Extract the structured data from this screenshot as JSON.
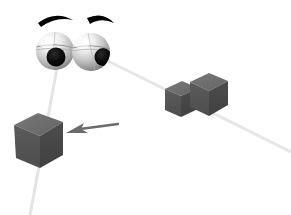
{
  "scene": {
    "title": "Gaze direction illustration",
    "description": "Two cartoon eyeballs with eyebrows look in two directions; faint gaze rays extend toward dark grey cubes, and an arrow points at the lower-left cube.",
    "width": 291,
    "height": 215,
    "background_color": "#ffffff"
  },
  "colors": {
    "background": "#ffffff",
    "eyebrow": "#000000",
    "pupil": "#000000",
    "sclera_light": "#f2f2f2",
    "sclera_mid": "#b9b9b9",
    "sclera_dark": "#8a8a8a",
    "cube_top": "#6e6e6e",
    "cube_left": "#555555",
    "cube_right": "#464646",
    "cube_small_top": "#7a7a7a",
    "cube_small_left": "#626262",
    "arrow": "#6b6b6b",
    "gaze_ray": "#e2e2e2"
  },
  "eyes": [
    {
      "name": "left-eye",
      "label": "Left eyeball",
      "cx": 55,
      "cy": 51,
      "r": 19,
      "pupil_cx": 56,
      "pupil_cy": 57,
      "pupil_r": 9,
      "gaze_target": "left-cube"
    },
    {
      "name": "right-eye",
      "label": "Right eyeball",
      "cx": 91,
      "cy": 52,
      "r": 19,
      "pupil_cx": 101,
      "pupil_cy": 57,
      "pupil_r": 8,
      "gaze_target": "cube-pair"
    }
  ],
  "eyebrows": [
    {
      "name": "left-eyebrow",
      "label": "Left eyebrow",
      "path": "M 38 22 Q 55 11 72 20 Q 55 16 40 26 Z"
    },
    {
      "name": "right-eyebrow",
      "label": "Right eyebrow",
      "path": "M 88 17 Q 104 12 113 23 Q 101 17 90 23 Z"
    }
  ],
  "cubes": [
    {
      "name": "left-cube",
      "label": "Target cube (lower left)",
      "top_face": "M 14 125 L 38 113 L 63 122 L 40 136 Z",
      "left_face": "M 14 125 L 40 136 L 40 168 L 16 158 Z",
      "right_face": "M 40 136 L 63 122 L 63 155 L 40 168 Z"
    },
    {
      "name": "cube-small-right",
      "label": "Small cube (right group, front-left)",
      "top_face": "M 165 89 L 182 81 L 198 88 L 181 96 Z",
      "left_face": "M 165 89 L 181 96 L 181 117 L 165 110 Z",
      "right_face": "M 181 96 L 198 88 L 198 109 L 181 117 Z"
    },
    {
      "name": "cube-large-right",
      "label": "Large cube (right group, back-right)",
      "top_face": "M 190 82 L 209 73 L 228 81 L 209 91 Z",
      "left_face": "M 190 82 L 209 91 L 209 116 L 190 107 Z",
      "right_face": "M 209 91 L 228 81 L 228 105 L 209 116 Z"
    }
  ],
  "gaze_rays": [
    {
      "name": "gaze-ray-left",
      "label": "Gaze ray from left eye to lower-left cube",
      "x1": 57,
      "y1": 68,
      "x2": 30,
      "y2": 215
    },
    {
      "name": "gaze-ray-right",
      "label": "Gaze ray from right eye to right cube pair",
      "x1": 106,
      "y1": 60,
      "x2": 291,
      "y2": 152
    }
  ],
  "arrow": {
    "name": "pointer-arrow",
    "label": "Arrow pointing at the lower-left cube",
    "tail_x": 118,
    "tail_y": 124,
    "head_x": 66,
    "head_y": 133,
    "shaft_path": "M 118 124 L 78 130",
    "head_path": "M 66 133 L 82 124 L 80 131 L 88 135 Z"
  }
}
